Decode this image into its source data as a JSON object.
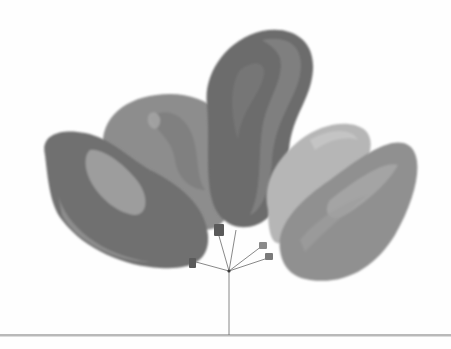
{
  "image": {
    "description": "Grayscale watercolor illustration of a bunch of five balloons tied together, strings converging to a single string that touches a horizontal ground line",
    "balloon_count": 5,
    "colors": {
      "background": "#fefefe",
      "ground_line": "#b9b9b9",
      "string": "#6a6a6a",
      "balloon_left": "#6f6f6f",
      "balloon_round": "#8c8c8c",
      "balloon_tall": "#6c6c6c",
      "balloon_light": "#b4b4b4",
      "balloon_right": "#8f8f8f",
      "knot": "#5a5a5a"
    }
  }
}
